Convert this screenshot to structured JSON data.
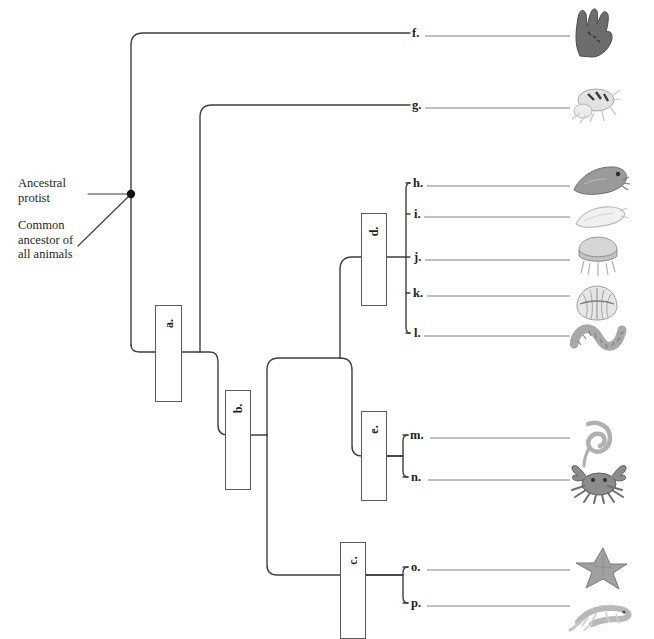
{
  "annotations": {
    "ancestral_protist": "Ancestral\nprotist",
    "common_ancestor": "Common\nancestor of\nall animals"
  },
  "node_boxes": [
    {
      "id": "a",
      "label": "a.",
      "x": 155,
      "y": 305,
      "w": 27,
      "h": 97
    },
    {
      "id": "b",
      "label": "b.",
      "x": 225,
      "y": 390,
      "w": 26,
      "h": 100
    },
    {
      "id": "c",
      "label": "c.",
      "x": 340,
      "y": 542,
      "w": 26,
      "h": 97
    },
    {
      "id": "d",
      "label": "d.",
      "x": 361,
      "y": 213,
      "w": 26,
      "h": 93
    },
    {
      "id": "e",
      "label": "e.",
      "x": 361,
      "y": 411,
      "w": 26,
      "h": 90
    }
  ],
  "blanks": [
    {
      "id": "f",
      "label": "f.",
      "y": 33,
      "tick_x": 410,
      "line_x1": 425,
      "line_x2": 570
    },
    {
      "id": "g",
      "label": "g.",
      "y": 105,
      "tick_x": 410,
      "line_x1": 425,
      "line_x2": 570
    },
    {
      "id": "h",
      "label": "h.",
      "y": 183,
      "tick_x": 410,
      "line_x1": 427,
      "line_x2": 570
    },
    {
      "id": "i",
      "label": "i.",
      "y": 214,
      "tick_x": 410,
      "line_x1": 424,
      "line_x2": 570
    },
    {
      "id": "j",
      "label": "j.",
      "y": 257,
      "tick_x": 410,
      "line_x1": 425,
      "line_x2": 570
    },
    {
      "id": "k",
      "label": "k.",
      "y": 293,
      "tick_x": 410,
      "line_x1": 427,
      "line_x2": 570
    },
    {
      "id": "l",
      "label": "l.",
      "y": 333,
      "tick_x": 410,
      "line_x1": 424,
      "line_x2": 570
    },
    {
      "id": "m",
      "label": "m.",
      "y": 435,
      "tick_x": 408,
      "line_x1": 430,
      "line_x2": 570
    },
    {
      "id": "n",
      "label": "n.",
      "y": 477,
      "tick_x": 408,
      "line_x1": 428,
      "line_x2": 570
    },
    {
      "id": "o",
      "label": "o.",
      "y": 567,
      "tick_x": 408,
      "line_x1": 427,
      "line_x2": 570
    },
    {
      "id": "p",
      "label": "p.",
      "y": 603,
      "tick_x": 408,
      "line_x1": 427,
      "line_x2": 570
    }
  ],
  "organisms": [
    {
      "id": "f",
      "icon": "sponge-icon",
      "x": 568,
      "y": 4,
      "w": 50,
      "h": 54,
      "tone": "#6d6d6d"
    },
    {
      "id": "g",
      "icon": "arthropod-icon",
      "x": 566,
      "y": 82,
      "w": 58,
      "h": 44,
      "tone": "#bdbdbd"
    },
    {
      "id": "h",
      "icon": "squid-icon",
      "x": 570,
      "y": 162,
      "w": 62,
      "h": 38,
      "tone": "#9a9a9a"
    },
    {
      "id": "i",
      "icon": "flatworm-icon",
      "x": 572,
      "y": 200,
      "w": 58,
      "h": 32,
      "tone": "#cfcfcf"
    },
    {
      "id": "j",
      "icon": "jellyfish-icon",
      "x": 572,
      "y": 232,
      "w": 50,
      "h": 46,
      "tone": "#b5b5b5"
    },
    {
      "id": "k",
      "icon": "clam-icon",
      "x": 574,
      "y": 282,
      "w": 46,
      "h": 42,
      "tone": "#c2c2c2"
    },
    {
      "id": "l",
      "icon": "segmented-worm-icon",
      "x": 570,
      "y": 314,
      "w": 58,
      "h": 40,
      "tone": "#a9a9a9"
    },
    {
      "id": "m",
      "icon": "roundworm-icon",
      "x": 578,
      "y": 418,
      "w": 40,
      "h": 50,
      "tone": "#b0b0b0"
    },
    {
      "id": "n",
      "icon": "crab-icon",
      "x": 568,
      "y": 460,
      "w": 62,
      "h": 44,
      "tone": "#8c8c8c"
    },
    {
      "id": "o",
      "icon": "starfish-icon",
      "x": 572,
      "y": 546,
      "w": 56,
      "h": 44,
      "tone": "#a0a0a0"
    },
    {
      "id": "p",
      "icon": "lizard-icon",
      "x": 568,
      "y": 596,
      "w": 64,
      "h": 38,
      "tone": "#b8b8b8"
    }
  ],
  "colors": {
    "branch": "#3f3f3f",
    "box_border": "#5a5a5a",
    "blank_line": "#808080",
    "text": "#231f20",
    "root_dot": "#111111"
  },
  "tree_geometry": {
    "root_dot": {
      "x": 131,
      "y": 194
    },
    "arrow_protist": {
      "x1": 88,
      "y1": 194,
      "x2": 129,
      "y2": 194
    },
    "arrow_ancestor": {
      "x1": 78,
      "y1": 246,
      "x2": 129,
      "y2": 196
    },
    "spine_root_x": 131,
    "spine_g_x": 200,
    "spine_b_x": 267,
    "spine_d_x": 340,
    "spine_hl_x": 406,
    "spine_mn_x": 403,
    "spine_op_x": 403,
    "y_a": 352,
    "y_b": 435,
    "y_c": 575,
    "y_d": 257,
    "y_e": 456
  }
}
